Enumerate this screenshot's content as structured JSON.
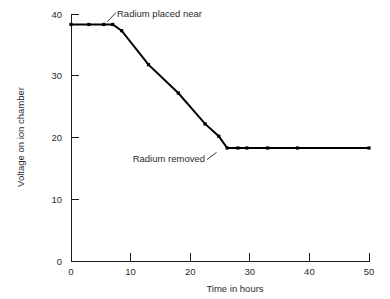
{
  "chart_data": {
    "type": "line",
    "title": "",
    "xlabel": "Time in hours",
    "ylabel": "Voltage on ion chamber",
    "xlim": [
      0,
      50
    ],
    "ylim": [
      0,
      40
    ],
    "xticks": [
      0,
      10,
      20,
      30,
      40,
      50
    ],
    "yticks": [
      0,
      10,
      20,
      30,
      40
    ],
    "xtick_labels": [
      "0",
      "10",
      "20",
      "30",
      "40",
      "50"
    ],
    "ytick_labels": [
      "0",
      "10",
      "20",
      "30",
      "40"
    ],
    "grid": false,
    "legend": false,
    "series": [
      {
        "name": "Voltage on ion chamber",
        "x": [
          0,
          3,
          5.5,
          7,
          8.5,
          13,
          18,
          22.5,
          24.8,
          26.2,
          28,
          29.5,
          33,
          38,
          50
        ],
        "y": [
          38.3,
          38.3,
          38.3,
          38.3,
          37.3,
          31.8,
          27.2,
          22.2,
          20.2,
          18.3,
          18.3,
          18.3,
          18.3,
          18.3,
          18.3
        ],
        "marker": "square",
        "color": "#000000"
      }
    ],
    "annotations": [
      {
        "text": "Radium placed near",
        "label_x": 10.4,
        "label_y": 40.5,
        "point_x": 7.0,
        "point_y": 38.3
      },
      {
        "text": "Radium removed",
        "label_x": 5.0,
        "label_y": 15.8,
        "point_x": 26.2,
        "point_y": 18.3
      }
    ]
  },
  "axes": {
    "x_title": "Time in hours",
    "y_title": "Voltage on ion chamber",
    "x_tick_0": "0",
    "x_tick_1": "10",
    "x_tick_2": "20",
    "x_tick_3": "30",
    "x_tick_4": "40",
    "x_tick_5": "50",
    "y_tick_0": "0",
    "y_tick_1": "10",
    "y_tick_2": "20",
    "y_tick_3": "30",
    "y_tick_4": "40"
  },
  "annotations": {
    "radium_placed": "Radium placed near",
    "radium_removed": "Radium removed"
  },
  "colors": {
    "line": "#000000",
    "axis": "#1a1a1a",
    "text": "#2b2b2b",
    "background": "#ffffff"
  }
}
